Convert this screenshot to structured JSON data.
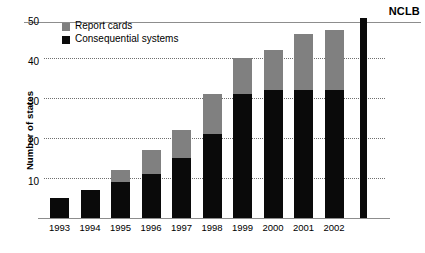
{
  "chart_data": {
    "type": "bar",
    "title": "",
    "subtitle": "",
    "xlabel": "",
    "ylabel": "Number of states",
    "stacked": true,
    "grid": true,
    "legend_position": "top-left",
    "ylim": [
      0,
      50
    ],
    "yticks": [
      10,
      20,
      30,
      40,
      50
    ],
    "categories": [
      "1993",
      "1994",
      "1995",
      "1996",
      "1997",
      "1998",
      "1999",
      "2000",
      "2001",
      "2002"
    ],
    "series": [
      {
        "name": "Consequential systems",
        "color": "#0a0a0a",
        "values": [
          5,
          7,
          9,
          11,
          15,
          21,
          31,
          32,
          32,
          32
        ]
      },
      {
        "name": "Report cards",
        "color": "#808080",
        "values": [
          0,
          0,
          3,
          6,
          7,
          10,
          9,
          10,
          14,
          15
        ]
      }
    ],
    "totals": [
      5,
      7,
      12,
      17,
      22,
      31,
      40,
      42,
      46,
      47
    ],
    "annotations": [
      {
        "label": "NCLB",
        "type": "vertical-marker-bar",
        "value": 50,
        "color": "#0a0a0a"
      }
    ]
  },
  "legend": {
    "items": [
      {
        "label": "Report cards",
        "color": "#808080",
        "swatch": "square-swatch-gray"
      },
      {
        "label": "Consequential systems",
        "color": "#0a0a0a",
        "swatch": "square-swatch-black"
      }
    ]
  },
  "axes": {
    "y_title": "Number of states",
    "y_ticks": [
      "50",
      "40",
      "30",
      "20",
      "10"
    ],
    "x_ticks": [
      "1993",
      "1994",
      "1995",
      "1996",
      "1997",
      "1998",
      "1999",
      "2000",
      "2001",
      "2002"
    ]
  },
  "marker": {
    "label": "NCLB"
  },
  "colors": {
    "report_cards": "#808080",
    "consequential_systems": "#0a0a0a",
    "gridline": "#6f6f6f",
    "axis": "#8d8d8d",
    "background": "#ffffff"
  }
}
